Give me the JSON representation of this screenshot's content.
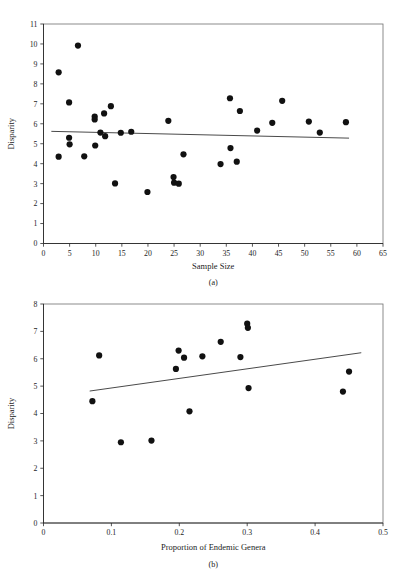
{
  "page": {
    "header_text": "",
    "background_color": "#ffffff"
  },
  "figure_a": {
    "caption": "(a)",
    "xlabel": "Sample Size",
    "ylabel": "Disparity"
  },
  "figure_b": {
    "caption": "(b)",
    "xlabel": "Proportion of Endemic Genera",
    "ylabel": "Disparity"
  },
  "chart_data": [
    {
      "id": "a",
      "type": "scatter",
      "title": "",
      "xlabel": "Sample Size",
      "ylabel": "Disparity",
      "caption": "(a)",
      "xlim": [
        0,
        65
      ],
      "ylim": [
        0,
        11
      ],
      "xticks": [
        0,
        5,
        10,
        15,
        20,
        25,
        30,
        35,
        40,
        45,
        50,
        55,
        60,
        65
      ],
      "yticks": [
        0,
        1,
        2,
        3,
        4,
        5,
        6,
        7,
        8,
        9,
        10,
        11
      ],
      "xtick_labels": [
        "0",
        "5",
        "10",
        "15",
        "20",
        "25",
        "30",
        "35",
        "40",
        "45",
        "50",
        "55",
        "60",
        "65"
      ],
      "ytick_labels": [
        "0",
        "1",
        "2",
        "3",
        "4",
        "5",
        "6",
        "7",
        "8",
        "9",
        "10",
        "11"
      ],
      "grid": false,
      "legend": null,
      "marker_color": "#111111",
      "trend_color": "#4a4a4a",
      "points": [
        {
          "x": 2.9,
          "y": 8.58
        },
        {
          "x": 2.9,
          "y": 4.35
        },
        {
          "x": 4.9,
          "y": 7.07
        },
        {
          "x": 4.9,
          "y": 5.3
        },
        {
          "x": 5.0,
          "y": 4.97
        },
        {
          "x": 6.6,
          "y": 9.92
        },
        {
          "x": 7.8,
          "y": 4.37
        },
        {
          "x": 9.8,
          "y": 6.36
        },
        {
          "x": 9.8,
          "y": 6.22
        },
        {
          "x": 9.9,
          "y": 4.91
        },
        {
          "x": 10.9,
          "y": 5.56
        },
        {
          "x": 11.6,
          "y": 6.52
        },
        {
          "x": 11.8,
          "y": 5.38
        },
        {
          "x": 12.9,
          "y": 6.88
        },
        {
          "x": 13.7,
          "y": 3.01
        },
        {
          "x": 14.8,
          "y": 5.55
        },
        {
          "x": 16.8,
          "y": 5.6
        },
        {
          "x": 19.9,
          "y": 2.58
        },
        {
          "x": 23.9,
          "y": 6.15
        },
        {
          "x": 24.9,
          "y": 3.33
        },
        {
          "x": 25.0,
          "y": 3.05
        },
        {
          "x": 25.9,
          "y": 3.0
        },
        {
          "x": 26.8,
          "y": 4.47
        },
        {
          "x": 33.9,
          "y": 3.98
        },
        {
          "x": 35.7,
          "y": 7.28
        },
        {
          "x": 35.8,
          "y": 4.78
        },
        {
          "x": 37.0,
          "y": 4.1
        },
        {
          "x": 37.6,
          "y": 6.64
        },
        {
          "x": 40.9,
          "y": 5.66
        },
        {
          "x": 43.8,
          "y": 6.05
        },
        {
          "x": 45.7,
          "y": 7.15
        },
        {
          "x": 50.8,
          "y": 6.11
        },
        {
          "x": 52.9,
          "y": 5.56
        },
        {
          "x": 57.9,
          "y": 6.08
        }
      ],
      "trend": {
        "x0": 1.5,
        "y0": 5.62,
        "x1": 58.5,
        "y1": 5.28
      }
    },
    {
      "id": "b",
      "type": "scatter",
      "title": "",
      "xlabel": "Proportion of Endemic Genera",
      "ylabel": "Disparity",
      "caption": "(b)",
      "xlim": [
        0,
        0.5
      ],
      "ylim": [
        0,
        8
      ],
      "xticks": [
        0,
        0.1,
        0.2,
        0.3,
        0.4,
        0.5
      ],
      "yticks": [
        0,
        1,
        2,
        3,
        4,
        5,
        6,
        7,
        8
      ],
      "xtick_labels": [
        "0",
        "0.1",
        "0.2",
        "0.3",
        "0.4",
        "0.5"
      ],
      "ytick_labels": [
        "0",
        "1",
        "2",
        "3",
        "4",
        "5",
        "6",
        "7",
        "8"
      ],
      "grid": false,
      "legend": null,
      "marker_color": "#111111",
      "trend_color": "#4a4a4a",
      "points": [
        {
          "x": 0.072,
          "y": 4.45
        },
        {
          "x": 0.082,
          "y": 6.12
        },
        {
          "x": 0.114,
          "y": 2.95
        },
        {
          "x": 0.159,
          "y": 3.01
        },
        {
          "x": 0.195,
          "y": 5.63
        },
        {
          "x": 0.199,
          "y": 6.3
        },
        {
          "x": 0.207,
          "y": 6.04
        },
        {
          "x": 0.215,
          "y": 4.08
        },
        {
          "x": 0.234,
          "y": 6.09
        },
        {
          "x": 0.261,
          "y": 6.62
        },
        {
          "x": 0.29,
          "y": 6.06
        },
        {
          "x": 0.3,
          "y": 7.28
        },
        {
          "x": 0.301,
          "y": 7.13
        },
        {
          "x": 0.302,
          "y": 4.93
        },
        {
          "x": 0.441,
          "y": 4.8
        },
        {
          "x": 0.45,
          "y": 5.53
        }
      ],
      "trend": {
        "x0": 0.068,
        "y0": 4.82,
        "x1": 0.468,
        "y1": 6.22
      }
    }
  ]
}
